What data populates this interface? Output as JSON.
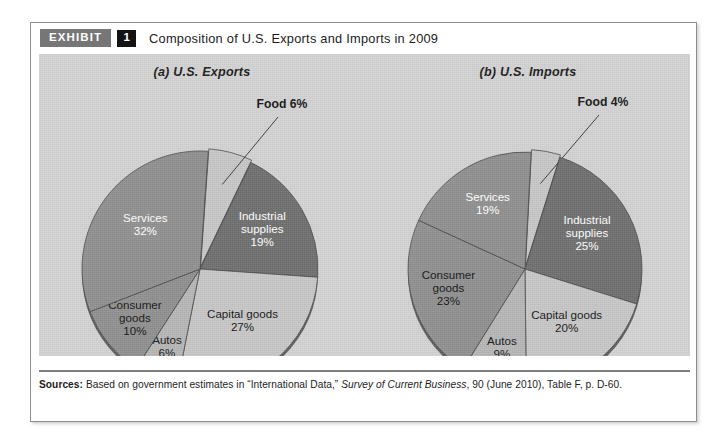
{
  "exhibit": {
    "badge_label": "EXHIBIT",
    "number": "1",
    "title": "Composition of U.S. Exports and Imports in 2009"
  },
  "sources": {
    "label": "Sources:",
    "text_before_italic": " Based on government estimates in “International Data,” ",
    "italic_title": "Survey of Current Business",
    "text_after_italic": ", 90 (June 2010), Table F, p. D-60."
  },
  "colors": {
    "panel_background": "#d2d2d2",
    "slice_dark": "#6e6e6e",
    "slice_mid": "#8f8f8f",
    "slice_light": "#c6c6c6",
    "slice_pale": "#b5b5b5",
    "outline": "#4a4a4a",
    "badge_gray": "#767676",
    "badge_black": "#131313"
  },
  "chart_data": [
    {
      "type": "pie",
      "title": "(a) U.S. Exports",
      "categories": [
        "Food",
        "Industrial supplies",
        "Capital goods",
        "Autos",
        "Consumer goods",
        "Services"
      ],
      "values": [
        6,
        19,
        27,
        6,
        10,
        32
      ],
      "labels": [
        {
          "name": "Food",
          "pct": "6%",
          "display": "Food 6%",
          "placement": "callout",
          "color": "#c6c6c6",
          "text_color": "dark"
        },
        {
          "name": "Industrial",
          "name_line2": "supplies",
          "pct": "19%",
          "placement": "inside",
          "color": "#6e6e6e",
          "text_color": "light"
        },
        {
          "name": "Capital goods",
          "pct": "27%",
          "placement": "inside",
          "color": "#c6c6c6",
          "text_color": "dark"
        },
        {
          "name": "Autos",
          "pct": "6%",
          "placement": "inside",
          "color": "#b5b5b5",
          "text_color": "dark"
        },
        {
          "name": "Consumer",
          "name_line2": "goods",
          "pct": "10%",
          "placement": "inside",
          "color": "#8f8f8f",
          "text_color": "dark"
        },
        {
          "name": "Services",
          "pct": "32%",
          "placement": "inside",
          "color": "#8f8f8f",
          "text_color": "light"
        }
      ],
      "units": "percent",
      "legend": "none"
    },
    {
      "type": "pie",
      "title": "(b) U.S. Imports",
      "categories": [
        "Food",
        "Industrial supplies",
        "Capital goods",
        "Autos",
        "Consumer goods",
        "Services"
      ],
      "values": [
        4,
        25,
        20,
        9,
        23,
        19
      ],
      "labels": [
        {
          "name": "Food",
          "pct": "4%",
          "display": "Food 4%",
          "placement": "callout",
          "color": "#c6c6c6",
          "text_color": "dark"
        },
        {
          "name": "Industrial",
          "name_line2": "supplies",
          "pct": "25%",
          "placement": "inside",
          "color": "#6e6e6e",
          "text_color": "light"
        },
        {
          "name": "Capital goods",
          "pct": "20%",
          "placement": "inside",
          "color": "#c6c6c6",
          "text_color": "dark"
        },
        {
          "name": "Autos",
          "pct": "9%",
          "placement": "inside",
          "color": "#b5b5b5",
          "text_color": "dark"
        },
        {
          "name": "Consumer",
          "name_line2": "goods",
          "pct": "23%",
          "placement": "inside",
          "color": "#8f8f8f",
          "text_color": "dark"
        },
        {
          "name": "Services",
          "pct": "19%",
          "placement": "inside",
          "color": "#8f8f8f",
          "text_color": "light"
        }
      ],
      "units": "percent",
      "legend": "none"
    }
  ]
}
